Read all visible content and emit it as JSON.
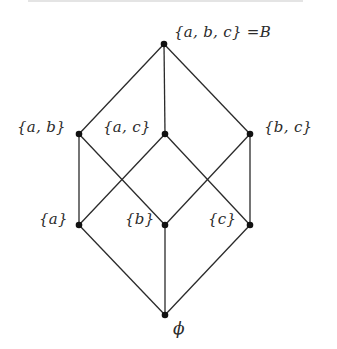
{
  "diagram": {
    "type": "hasse-diagram",
    "colors": {
      "background": "#ffffff",
      "edge": "#2a2a2a",
      "node": "#111111",
      "text": "#2b2b2b"
    },
    "nodes": {
      "abc": {
        "label": "{a, b, c} =B",
        "x": 164,
        "y": 44
      },
      "ab": {
        "label": "{a, b}",
        "x": 79,
        "y": 134
      },
      "ac": {
        "label": "{a, c}",
        "x": 165,
        "y": 134
      },
      "bc": {
        "label": "{b, c}",
        "x": 250,
        "y": 134
      },
      "a": {
        "label": "{a}",
        "x": 79,
        "y": 225
      },
      "b": {
        "label": "{b}",
        "x": 165,
        "y": 225
      },
      "c": {
        "label": "{c}",
        "x": 250,
        "y": 225
      },
      "empty": {
        "label": "ϕ",
        "x": 165,
        "y": 315
      }
    },
    "edges": [
      [
        "abc",
        "ab"
      ],
      [
        "abc",
        "ac"
      ],
      [
        "abc",
        "bc"
      ],
      [
        "ab",
        "a"
      ],
      [
        "ab",
        "b"
      ],
      [
        "ac",
        "a"
      ],
      [
        "ac",
        "c"
      ],
      [
        "bc",
        "b"
      ],
      [
        "bc",
        "c"
      ],
      [
        "a",
        "empty"
      ],
      [
        "b",
        "empty"
      ],
      [
        "c",
        "empty"
      ]
    ]
  }
}
